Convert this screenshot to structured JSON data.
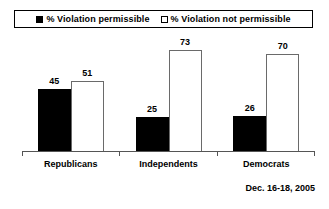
{
  "legend": {
    "entries": [
      {
        "swatch": "filled-square-icon",
        "label": "% Violation permissible"
      },
      {
        "swatch": "open-square-icon",
        "label": "% Violation not permissible"
      }
    ]
  },
  "footer": {
    "note": "Dec. 16-18, 2005"
  },
  "colors": {
    "series_permissible": "#000000",
    "series_not_permissible": "#ffffff",
    "bar_outline": "#6a6a6a",
    "axis": "#555555",
    "background": "#ffffff",
    "text": "#000000"
  },
  "chart_data": {
    "type": "bar",
    "title": "",
    "xlabel": "",
    "ylabel": "",
    "ylim": [
      0,
      80
    ],
    "grid": false,
    "legend_position": "top",
    "categories": [
      "Republicans",
      "Independents",
      "Democrats"
    ],
    "series": [
      {
        "name": "% Violation permissible",
        "values": [
          45,
          25,
          26
        ]
      },
      {
        "name": "% Violation not permissible",
        "values": [
          51,
          73,
          70
        ]
      }
    ],
    "annotations": [
      "Dec. 16-18, 2005"
    ]
  }
}
